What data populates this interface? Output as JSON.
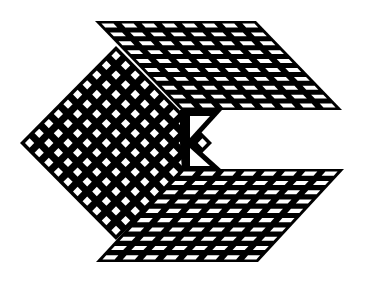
{
  "image": {
    "type": "logo",
    "description": "Black isometric grid-mesh cube shape forming a letter C",
    "colors": {
      "ink": "#000000",
      "background": "#ffffff"
    },
    "panels": [
      {
        "name": "top-face",
        "columns": 8,
        "rows": 10
      },
      {
        "name": "left-face",
        "columns": 10,
        "rows": 10
      },
      {
        "name": "bottom-face",
        "columns": 8,
        "rows": 10
      }
    ]
  }
}
